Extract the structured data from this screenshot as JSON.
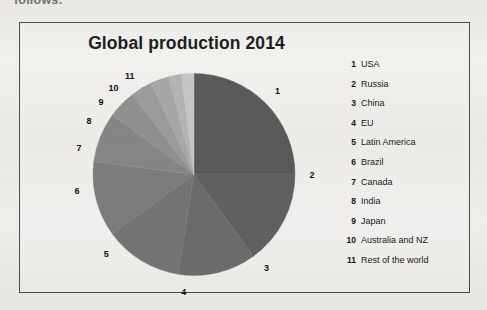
{
  "document": {
    "clipped_text_above_figure": "follows:"
  },
  "figure": {
    "title": "Global production 2014",
    "border_color": "#4a4a4a",
    "background_color": "#eeedea"
  },
  "legend": {
    "items": [
      {
        "key": "1",
        "label": "USA"
      },
      {
        "key": "2",
        "label": "Russia"
      },
      {
        "key": "3",
        "label": "China"
      },
      {
        "key": "4",
        "label": "EU"
      },
      {
        "key": "5",
        "label": "Latin America"
      },
      {
        "key": "6",
        "label": "Brazil"
      },
      {
        "key": "7",
        "label": "Canada"
      },
      {
        "key": "8",
        "label": "India"
      },
      {
        "key": "9",
        "label": "Japan"
      },
      {
        "key": "10",
        "label": "Australia and NZ"
      },
      {
        "key": "11",
        "label": "Rest of the world"
      }
    ]
  },
  "chart_data": {
    "type": "pie",
    "title": "Global production 2014",
    "xlabel": "",
    "ylabel": "",
    "grid": false,
    "legend_position": "right",
    "start_angle_deg": 0,
    "direction": "clockwise",
    "labels_are": "numeric keys placed outside each slice",
    "categories": [
      "USA",
      "Russia",
      "China",
      "EU",
      "Latin America",
      "Brazil",
      "Canada",
      "India",
      "Japan",
      "Australia and NZ",
      "Rest of the world"
    ],
    "keys": [
      "1",
      "2",
      "3",
      "4",
      "5",
      "6",
      "7",
      "8",
      "9",
      "10",
      "11"
    ],
    "values": [
      25.0,
      15.0,
      12.5,
      12.5,
      12.0,
      8.0,
      4.5,
      3.5,
      3.0,
      2.0,
      2.0
    ],
    "units": "percent of global production",
    "slice_colors": [
      "#595959",
      "#5f5f5f",
      "#6a6a6a",
      "#737373",
      "#7b7b7b",
      "#858585",
      "#8f8f8f",
      "#9b9b9b",
      "#a7a7a7",
      "#b4b4b4",
      "#c6c6c6"
    ],
    "label_positions_deg": [
      45,
      90,
      142,
      185,
      228,
      262,
      283,
      297,
      308,
      317,
      327
    ]
  }
}
